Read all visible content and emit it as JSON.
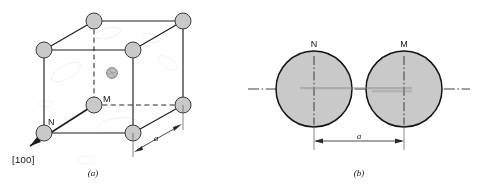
{
  "figure": {
    "background_color": "#ffffff",
    "atom_fill_color": "#c9c9c9",
    "line_color": "#1c1c1c"
  },
  "panel_a": {
    "caption": "(a)",
    "direction_label": "[100]",
    "atom_labels": {
      "center": "M",
      "corner_front_left_bottom": "N"
    },
    "dimension_label": "a",
    "atoms": [
      {
        "name": "top-back-left",
        "cx": 44,
        "cy": 50,
        "r": 8.0
      },
      {
        "name": "top-back-right",
        "cx": 94,
        "cy": 21,
        "r": 8.0
      },
      {
        "name": "top-front-right",
        "cx": 133,
        "cy": 50,
        "r": 8.0
      },
      {
        "name": "top-far-right",
        "cx": 183,
        "cy": 21,
        "r": 8.0
      },
      {
        "name": "bottom-front-left",
        "cx": 44,
        "cy": 133,
        "r": 8.0
      },
      {
        "name": "bottom-front-right",
        "cx": 133,
        "cy": 133,
        "r": 8.0
      },
      {
        "name": "bottom-back-right",
        "cx": 183,
        "cy": 105,
        "r": 8.0
      },
      {
        "name": "body-center",
        "cx": 94,
        "cy": 105,
        "r": 8.0
      },
      {
        "name": "interstitial-small",
        "cx": 112,
        "cy": 73,
        "r": 5.4
      }
    ]
  },
  "panel_b": {
    "caption": "(b)",
    "circle_left_label": "N",
    "circle_right_label": "M",
    "dimension_label": "a",
    "circles": [
      {
        "name": "sphere-N",
        "cx": 314,
        "cy": 89,
        "r": 38
      },
      {
        "name": "sphere-M",
        "cx": 404,
        "cy": 89,
        "r": 38
      }
    ]
  }
}
